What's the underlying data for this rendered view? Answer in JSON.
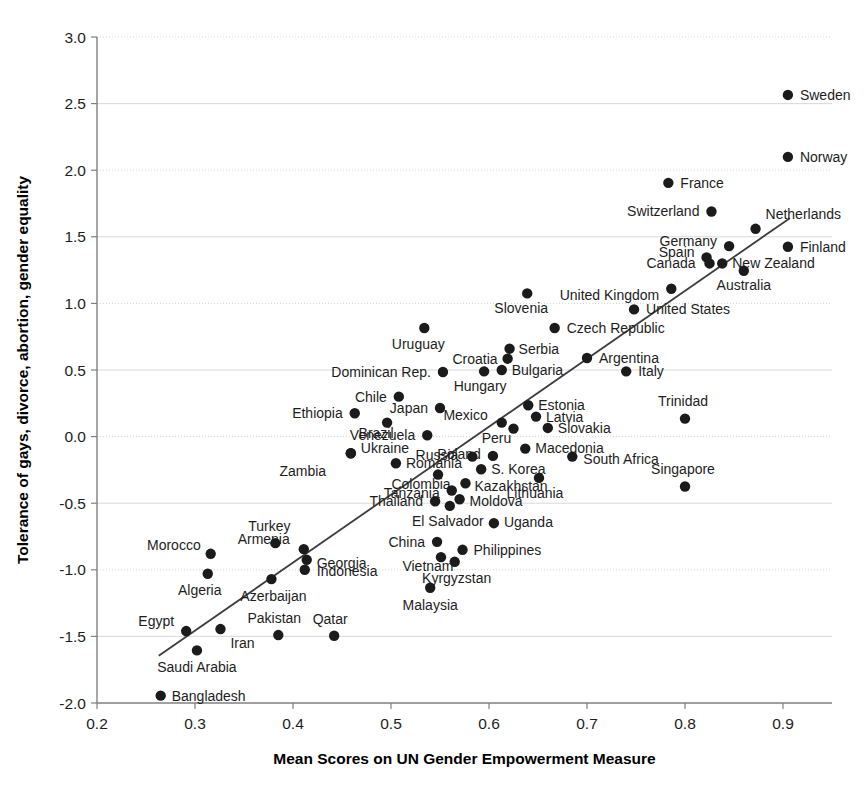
{
  "chart_data": {
    "type": "scatter",
    "title": "",
    "xlabel": "Mean Scores on UN Gender Empowerment Measure",
    "ylabel": "Tolerance of gays, divorce, abortion, gender equality",
    "xlim": [
      0.2,
      0.95
    ],
    "ylim": [
      -2.0,
      3.0
    ],
    "xticks": [
      "0.2",
      "0.3",
      "0.4",
      "0.5",
      "0.6",
      "0.7",
      "0.8",
      "0.9"
    ],
    "xtick_values": [
      0.2,
      0.3,
      0.4,
      0.5,
      0.6,
      0.7,
      0.8,
      0.9
    ],
    "yticks": [
      "3.0",
      "2.5",
      "2.0",
      "1.5",
      "1.0",
      "0.5",
      "0.0",
      "-0.5",
      "-1.0",
      "-1.5",
      "-2.0"
    ],
    "ytick_values": [
      3.0,
      2.5,
      2.0,
      1.5,
      1.0,
      0.5,
      0.0,
      -0.5,
      -1.0,
      -1.5,
      -2.0
    ],
    "grid": "horizontal",
    "legend": "none",
    "point_color": "#1b1b1b",
    "trendline": {
      "x0": 0.263,
      "y0": -1.645,
      "x1": 0.907,
      "y1": 1.64,
      "color": "#3c3c3c"
    },
    "points": [
      {
        "name": "Sweden",
        "x": 0.905,
        "y": 2.565,
        "lx": 12,
        "ly": 5,
        "anchor": "start"
      },
      {
        "name": "Norway",
        "x": 0.905,
        "y": 2.1,
        "lx": 12,
        "ly": 5,
        "anchor": "start"
      },
      {
        "name": "France",
        "x": 0.783,
        "y": 1.905,
        "lx": 12,
        "ly": 5,
        "anchor": "start"
      },
      {
        "name": "Switzerland",
        "x": 0.827,
        "y": 1.69,
        "lx": -12,
        "ly": 5,
        "anchor": "end"
      },
      {
        "name": "Netherlands",
        "x": 0.872,
        "y": 1.56,
        "lx": 10,
        "ly": -10,
        "anchor": "start"
      },
      {
        "name": "Germany",
        "x": 0.845,
        "y": 1.43,
        "lx": -12,
        "ly": 0,
        "anchor": "end"
      },
      {
        "name": "Finland",
        "x": 0.905,
        "y": 1.425,
        "lx": 12,
        "ly": 5,
        "anchor": "start"
      },
      {
        "name": "Spain",
        "x": 0.822,
        "y": 1.345,
        "lx": -12,
        "ly": 0,
        "anchor": "end"
      },
      {
        "name": "New Zealand",
        "x": 0.838,
        "y": 1.3,
        "lx": 10,
        "ly": 5,
        "anchor": "start"
      },
      {
        "name": "Canada",
        "x": 0.825,
        "y": 1.3,
        "lx": -14,
        "ly": 5,
        "anchor": "end"
      },
      {
        "name": "Australia",
        "x": 0.86,
        "y": 1.245,
        "lx": 0,
        "ly": 19,
        "anchor": "middle"
      },
      {
        "name": "United Kingdom",
        "x": 0.786,
        "y": 1.11,
        "lx": -12,
        "ly": 11,
        "anchor": "end"
      },
      {
        "name": "United States",
        "x": 0.748,
        "y": 0.955,
        "lx": 12,
        "ly": 5,
        "anchor": "start"
      },
      {
        "name": "Slovenia",
        "x": 0.639,
        "y": 1.075,
        "lx": -6,
        "ly": 20,
        "anchor": "middle"
      },
      {
        "name": "Czech Republic",
        "x": 0.667,
        "y": 0.815,
        "lx": 12,
        "ly": 5,
        "anchor": "start"
      },
      {
        "name": "Uruguay",
        "x": 0.534,
        "y": 0.815,
        "lx": -6,
        "ly": 21,
        "anchor": "middle"
      },
      {
        "name": "Serbia",
        "x": 0.621,
        "y": 0.66,
        "lx": 9,
        "ly": 5,
        "anchor": "start"
      },
      {
        "name": "Croatia",
        "x": 0.619,
        "y": 0.585,
        "lx": -10,
        "ly": 5,
        "anchor": "end"
      },
      {
        "name": "Argentina",
        "x": 0.7,
        "y": 0.59,
        "lx": 12,
        "ly": 5,
        "anchor": "start"
      },
      {
        "name": "Bulgaria",
        "x": 0.613,
        "y": 0.5,
        "lx": 10,
        "ly": 5,
        "anchor": "start"
      },
      {
        "name": "Hungary",
        "x": 0.595,
        "y": 0.49,
        "lx": -4,
        "ly": 20,
        "anchor": "middle"
      },
      {
        "name": "Dominican Rep.",
        "x": 0.553,
        "y": 0.485,
        "lx": -12,
        "ly": 5,
        "anchor": "end"
      },
      {
        "name": "Italy",
        "x": 0.74,
        "y": 0.49,
        "lx": 12,
        "ly": 5,
        "anchor": "start"
      },
      {
        "name": "Chile",
        "x": 0.508,
        "y": 0.3,
        "lx": -12,
        "ly": 5,
        "anchor": "end"
      },
      {
        "name": "Estonia",
        "x": 0.64,
        "y": 0.235,
        "lx": 10,
        "ly": 5,
        "anchor": "start"
      },
      {
        "name": "Japan",
        "x": 0.55,
        "y": 0.215,
        "lx": -12,
        "ly": 5,
        "anchor": "end"
      },
      {
        "name": "Ethiopia",
        "x": 0.463,
        "y": 0.175,
        "lx": -12,
        "ly": 5,
        "anchor": "end"
      },
      {
        "name": "Latvia",
        "x": 0.648,
        "y": 0.15,
        "lx": 10,
        "ly": 5,
        "anchor": "start"
      },
      {
        "name": "Mexico",
        "x": 0.613,
        "y": 0.105,
        "lx": -14,
        "ly": -3,
        "anchor": "end"
      },
      {
        "name": "Brazil",
        "x": 0.496,
        "y": 0.105,
        "lx": -11,
        "ly": 15,
        "anchor": "middle"
      },
      {
        "name": "Trinidad",
        "x": 0.8,
        "y": 0.135,
        "lx": -2,
        "ly": -13,
        "anchor": "middle"
      },
      {
        "name": "Slovakia",
        "x": 0.66,
        "y": 0.065,
        "lx": 10,
        "ly": 5,
        "anchor": "start"
      },
      {
        "name": "Peru",
        "x": 0.625,
        "y": 0.06,
        "lx": -17,
        "ly": 14,
        "anchor": "middle"
      },
      {
        "name": "Venezuela",
        "x": 0.537,
        "y": 0.01,
        "lx": -12,
        "ly": 5,
        "anchor": "end"
      },
      {
        "name": "Macedonia",
        "x": 0.637,
        "y": -0.09,
        "lx": 10,
        "ly": 4,
        "anchor": "start"
      },
      {
        "name": "Poland",
        "x": 0.604,
        "y": -0.145,
        "lx": -12,
        "ly": 3,
        "anchor": "end"
      },
      {
        "name": "Russia",
        "x": 0.583,
        "y": -0.15,
        "lx": -14,
        "ly": 3,
        "anchor": "end"
      },
      {
        "name": "South Africa",
        "x": 0.685,
        "y": -0.15,
        "lx": 11,
        "ly": 7,
        "anchor": "start"
      },
      {
        "name": "Ukraine",
        "x": 0.459,
        "y": -0.125,
        "lx": 10,
        "ly": 0,
        "anchor": "start"
      },
      {
        "name": "Romania",
        "x": 0.505,
        "y": -0.2,
        "lx": 10,
        "ly": 5,
        "anchor": "start"
      },
      {
        "name": "Zambia",
        "x": 0.459,
        "y": -0.125,
        "lx": -48,
        "ly": 23,
        "anchor": "middle"
      },
      {
        "name": "S. Korea",
        "x": 0.592,
        "y": -0.245,
        "lx": 10,
        "ly": 5,
        "anchor": "start"
      },
      {
        "name": "Colombia",
        "x": 0.548,
        "y": -0.285,
        "lx": -17,
        "ly": 14,
        "anchor": "middle"
      },
      {
        "name": "Singapore",
        "x": 0.8,
        "y": -0.375,
        "lx": -2,
        "ly": -13,
        "anchor": "middle"
      },
      {
        "name": "Kazakhstan",
        "x": 0.576,
        "y": -0.35,
        "lx": 9,
        "ly": 8,
        "anchor": "start"
      },
      {
        "name": "Lithuania",
        "x": 0.651,
        "y": -0.31,
        "lx": -4,
        "ly": 20,
        "anchor": "middle"
      },
      {
        "name": "Tanzania",
        "x": 0.562,
        "y": -0.405,
        "lx": -12,
        "ly": 7,
        "anchor": "end"
      },
      {
        "name": "Moldova",
        "x": 0.57,
        "y": -0.47,
        "lx": 10,
        "ly": 7,
        "anchor": "start"
      },
      {
        "name": "Thailand",
        "x": 0.545,
        "y": -0.485,
        "lx": -12,
        "ly": 5,
        "anchor": "end"
      },
      {
        "name": "El Salvador",
        "x": 0.56,
        "y": -0.52,
        "lx": -2,
        "ly": 20,
        "anchor": "middle"
      },
      {
        "name": "Uganda",
        "x": 0.605,
        "y": -0.65,
        "lx": 10,
        "ly": 4,
        "anchor": "start"
      },
      {
        "name": "Turkey",
        "x": 0.382,
        "y": -0.8,
        "lx": -6,
        "ly": -12,
        "anchor": "middle"
      },
      {
        "name": "Armenia",
        "x": 0.411,
        "y": -0.845,
        "lx": -14,
        "ly": -5,
        "anchor": "end"
      },
      {
        "name": "Philippines",
        "x": 0.573,
        "y": -0.85,
        "lx": 11,
        "ly": 5,
        "anchor": "start"
      },
      {
        "name": "China",
        "x": 0.547,
        "y": -0.79,
        "lx": -12,
        "ly": 5,
        "anchor": "end"
      },
      {
        "name": "Morocco",
        "x": 0.316,
        "y": -0.88,
        "lx": -10,
        "ly": -4,
        "anchor": "end"
      },
      {
        "name": "Georgia",
        "x": 0.414,
        "y": -0.925,
        "lx": 10,
        "ly": 8,
        "anchor": "start"
      },
      {
        "name": "Vietnam",
        "x": 0.551,
        "y": -0.905,
        "lx": -13,
        "ly": 14,
        "anchor": "middle"
      },
      {
        "name": "Indonesia",
        "x": 0.412,
        "y": -1.0,
        "lx": 12,
        "ly": 6,
        "anchor": "start"
      },
      {
        "name": "Kyrgyzstan",
        "x": 0.565,
        "y": -0.94,
        "lx": 2,
        "ly": 21,
        "anchor": "middle"
      },
      {
        "name": "Algeria",
        "x": 0.313,
        "y": -1.03,
        "lx": -8,
        "ly": 21,
        "anchor": "middle"
      },
      {
        "name": "Azerbaijan",
        "x": 0.378,
        "y": -1.07,
        "lx": 2,
        "ly": 22,
        "anchor": "middle"
      },
      {
        "name": "Malaysia",
        "x": 0.54,
        "y": -1.135,
        "lx": 0,
        "ly": 22,
        "anchor": "middle"
      },
      {
        "name": "Egypt",
        "x": 0.291,
        "y": -1.46,
        "lx": -12,
        "ly": -5,
        "anchor": "end"
      },
      {
        "name": "Pakistan",
        "x": 0.385,
        "y": -1.49,
        "lx": -4,
        "ly": -12,
        "anchor": "middle"
      },
      {
        "name": "Qatar",
        "x": 0.442,
        "y": -1.495,
        "lx": -4,
        "ly": -12,
        "anchor": "middle"
      },
      {
        "name": "Iran",
        "x": 0.326,
        "y": -1.445,
        "lx": 10,
        "ly": 19,
        "anchor": "start"
      },
      {
        "name": "Saudi Arabia",
        "x": 0.302,
        "y": -1.605,
        "lx": 0,
        "ly": 22,
        "anchor": "middle"
      },
      {
        "name": "Bangladesh",
        "x": 0.265,
        "y": -1.945,
        "lx": 11,
        "ly": 5,
        "anchor": "start"
      }
    ]
  }
}
